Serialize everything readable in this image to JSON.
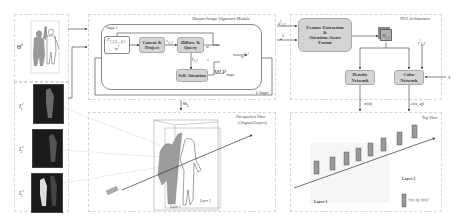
{
  "figure": {
    "modules": {
      "alignment": {
        "title": "Human-Image Alignment Module",
        "stage_label": "Stage 1",
        "repeat_label": "L Stages"
      },
      "nvs": {
        "title": "NVS Architecture"
      },
      "perspective": {
        "title_line1": "Perspective View",
        "title_line2": "(Aligned Layers)"
      },
      "topview": {
        "title": "Top View"
      }
    },
    "inputs": {
      "theta0": "Θ",
      "theta0_sup": "0",
      "images": [
        {
          "label": "I",
          "sub": "1",
          "sup": "t"
        },
        {
          "label": "I",
          "sub": "2",
          "sup": "t"
        },
        {
          "label": "I",
          "sub": "3",
          "sup": "t"
        }
      ]
    },
    "alignment_blocks": {
      "input_box_line1": "Γ",
      "input_box_line1_sub": "1,2,3,...,L1",
      "input_box_line2": "w",
      "input_box_line2_sup": "l",
      "concat": "Concat & Project",
      "diffuse": "Diffuse & Query",
      "self_attention": "Self-Attention",
      "edge_cl": "c",
      "edge_cl_sub": "1,2",
      "edge_fl": "f",
      "edge_fl_sub": "1,2",
      "edge_w": "w",
      "edge_s": "s",
      "output_w": "w",
      "output_w_sup": "l+1",
      "mlp": "MLP",
      "mlp_sub": "shape"
    },
    "theta_L": {
      "label": "Θ",
      "sub": "L"
    },
    "nvs_blocks": {
      "input_d": "d",
      "input_d_sub": "1,2",
      "input_d_sup": "i",
      "input_a": "a",
      "input_a_sup": "L",
      "feature_fusion_line1": "Feature Extraction",
      "feature_fusion_line2": "&",
      "feature_fusion_line3": "Attention-Aware",
      "feature_fusion_line4": "Fusion",
      "cube_label": "H",
      "cube_sub": "1,2",
      "r_label": "r",
      "r_sub": "1,2",
      "r_sup": "i",
      "density": "Density Network",
      "color": "Color Network",
      "q_label": "q",
      "sigma_out": "σ(x)",
      "color_out": "c(x, q)"
    },
    "perspective_labels": {
      "layer1": "Layer 1",
      "layer2": "Layer 2"
    },
    "topview_labels": {
      "layer1": "Layer 1",
      "layer2": "Layer 2",
      "legend": "{c(x, q), σ(x)}"
    }
  }
}
